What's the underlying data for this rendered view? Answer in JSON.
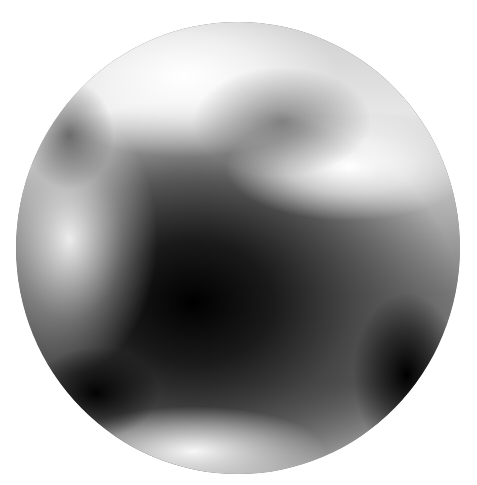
{
  "image": {
    "subject": "grayscale planetary sphere",
    "colors": {
      "background": "#ffffff",
      "darkest_region": "#000000",
      "brightest_region": "#ffffff",
      "mid_tone": "#8c8c8c"
    }
  }
}
